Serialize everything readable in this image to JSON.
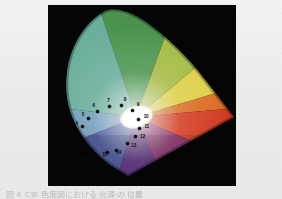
{
  "page": {
    "background_color": "#eceded",
    "caption_text": "図 4.  CIE 色度図における 光源 の 位置"
  },
  "figure": {
    "name": "cie-chromaticity-diagram",
    "panel_background": "#050505",
    "white_point_label": "white point",
    "regions": [
      {
        "name": "green",
        "color": "#4aa14a"
      },
      {
        "name": "yellow-green",
        "color": "#a8c83c"
      },
      {
        "name": "yellow",
        "color": "#e8d840"
      },
      {
        "name": "orange",
        "color": "#e8742a"
      },
      {
        "name": "red",
        "color": "#e03a20"
      },
      {
        "name": "magenta",
        "color": "#8c2a78"
      },
      {
        "name": "purple",
        "color": "#5a2a80"
      },
      {
        "name": "blue",
        "color": "#3a4a9e"
      },
      {
        "name": "cyan",
        "color": "#66a8c0"
      },
      {
        "name": "teal",
        "color": "#5ab59a"
      }
    ]
  },
  "chart_data": {
    "type": "scatter",
    "xlabel": "x",
    "ylabel": "y",
    "xlim": [
      0,
      0.8
    ],
    "ylim": [
      0,
      0.9
    ],
    "grid": false,
    "legend": "none",
    "annotations": [
      "white point"
    ],
    "point_labels": [
      "1",
      "2",
      "3",
      "4",
      "5",
      "6",
      "7",
      "8",
      "9",
      "10",
      "11",
      "12",
      "13",
      "14",
      "15",
      "16"
    ],
    "points": [
      {
        "label": "1",
        "x": 0.06,
        "y": 0.148
      },
      {
        "label": "2",
        "x": 0.055,
        "y": 0.196
      },
      {
        "label": "3",
        "x": 0.06,
        "y": 0.244
      },
      {
        "label": "4",
        "x": 0.078,
        "y": 0.286
      },
      {
        "label": "5",
        "x": 0.108,
        "y": 0.33
      },
      {
        "label": "6",
        "x": 0.15,
        "y": 0.366
      },
      {
        "label": "7",
        "x": 0.206,
        "y": 0.392
      },
      {
        "label": "8",
        "x": 0.266,
        "y": 0.398
      },
      {
        "label": "9",
        "x": 0.318,
        "y": 0.372
      },
      {
        "label": "10",
        "x": 0.346,
        "y": 0.324
      },
      {
        "label": "11",
        "x": 0.35,
        "y": 0.276
      },
      {
        "label": "12",
        "x": 0.33,
        "y": 0.23
      },
      {
        "label": "13",
        "x": 0.292,
        "y": 0.192
      },
      {
        "label": "14",
        "x": 0.24,
        "y": 0.156
      },
      {
        "label": "15",
        "x": 0.196,
        "y": 0.146
      },
      {
        "label": "16",
        "x": 0.104,
        "y": 0.112
      }
    ]
  }
}
